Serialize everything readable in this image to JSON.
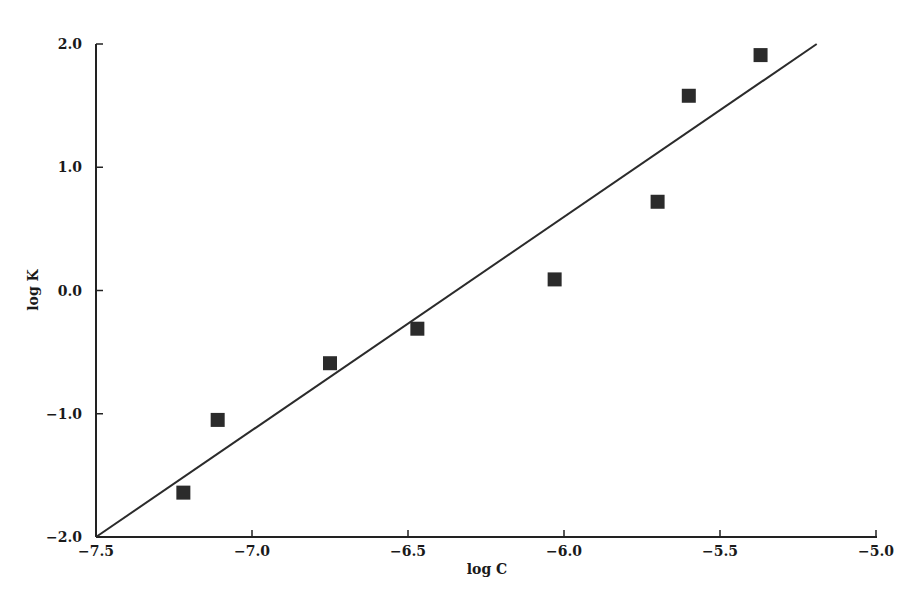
{
  "chart_data": {
    "type": "scatter",
    "title": "",
    "xlabel": "log C",
    "ylabel": "log K",
    "xlim": [
      -7.6,
      -4.98
    ],
    "ylim": [
      -2.0,
      2.0
    ],
    "x_ticks": [
      -7.5,
      -7.0,
      -6.5,
      -6.0,
      -5.5,
      -5.0
    ],
    "x_tick_labels": [
      "−7.5",
      "−7.0",
      "−6.5",
      "−6.0",
      "−5.5",
      "−5.0"
    ],
    "y_ticks": [
      2.0,
      1.0,
      0.0,
      -1.0,
      -2.0
    ],
    "y_tick_labels": [
      "2.0",
      "1.0",
      "0.0",
      "−1.0",
      "−2.0"
    ],
    "grid": false,
    "legend": null,
    "series": [
      {
        "name": "data",
        "marker": "square",
        "color": "#2b2b2b",
        "x": [
          -7.22,
          -7.11,
          -6.75,
          -6.47,
          -6.03,
          -5.7,
          -5.6,
          -5.37
        ],
        "y": [
          -1.64,
          -1.05,
          -0.59,
          -0.31,
          0.09,
          0.72,
          1.58,
          1.91
        ]
      },
      {
        "name": "fit",
        "type": "line",
        "color": "#2b2b2b",
        "x": [
          -7.5,
          -5.19
        ],
        "y": [
          -2.0,
          2.0
        ]
      }
    ]
  }
}
